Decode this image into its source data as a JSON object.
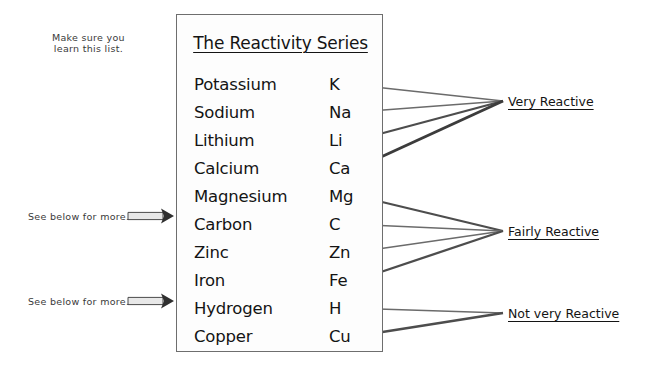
{
  "diagram": {
    "title": "The Reactivity Series",
    "box": {
      "left": 176,
      "top": 14,
      "width": 207,
      "height": 338
    },
    "title_top": 18,
    "row_height": 28,
    "first_row_top": 56,
    "elements": [
      {
        "name": "Potassium",
        "symbol": "K"
      },
      {
        "name": "Sodium",
        "symbol": "Na"
      },
      {
        "name": "Lithium",
        "symbol": "Li"
      },
      {
        "name": "Calcium",
        "symbol": "Ca"
      },
      {
        "name": "Magnesium",
        "symbol": "Mg"
      },
      {
        "name": "Carbon",
        "symbol": "C"
      },
      {
        "name": "Zinc",
        "symbol": "Zn"
      },
      {
        "name": "Iron",
        "symbol": "Fe"
      },
      {
        "name": "Hydrogen",
        "symbol": "H"
      },
      {
        "name": "Copper",
        "symbol": "Cu"
      }
    ],
    "groups": [
      {
        "label": "Very Reactive",
        "label_left": 508,
        "label_top": 94,
        "hub": {
          "x": 503,
          "y": 101
        },
        "targets": [
          "Potassium",
          "Sodium",
          "Lithium",
          "Calcium"
        ]
      },
      {
        "label": "Fairly Reactive",
        "label_left": 508,
        "label_top": 224,
        "hub": {
          "x": 503,
          "y": 231
        },
        "targets": [
          "Magnesium",
          "Carbon",
          "Zinc",
          "Iron"
        ]
      },
      {
        "label": "Not very Reactive",
        "label_left": 508,
        "label_top": 306,
        "hub": {
          "x": 503,
          "y": 313
        },
        "targets": [
          "Hydrogen",
          "Copper"
        ]
      }
    ],
    "notes": [
      {
        "id": "learn-list",
        "lines": [
          "Make sure you",
          "learn this list."
        ],
        "left": 52,
        "top": 32,
        "has_arrow": false
      },
      {
        "id": "carbon-note",
        "lines": [
          "See below for more."
        ],
        "left": 28,
        "top": 211,
        "has_arrow": true,
        "arrow": {
          "x1": 128,
          "y1": 216,
          "x2": 174,
          "y2": 216
        }
      },
      {
        "id": "hydrogen-note",
        "lines": [
          "See below for more."
        ],
        "left": 28,
        "top": 296,
        "has_arrow": true,
        "arrow": {
          "x1": 128,
          "y1": 301,
          "x2": 174,
          "y2": 301
        }
      }
    ],
    "colors": {
      "box_border": "#6e6e6e",
      "text": "#141414",
      "note_text": "#3a3a3a",
      "arrow_dark": "#3c3c3c",
      "arrow_light": "#8e8e8e",
      "background": "#ffffff"
    }
  }
}
